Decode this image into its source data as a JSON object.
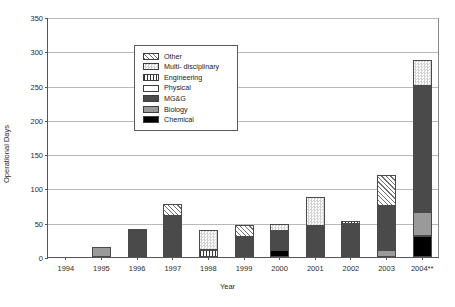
{
  "chart_data": {
    "type": "bar",
    "title": "",
    "xlabel": "Year",
    "ylabel": "Operational Days",
    "ylim": [
      0,
      350
    ],
    "ytick_step": 50,
    "yticks": [
      "350",
      "300",
      "250",
      "200",
      "150",
      "100",
      "50",
      "0"
    ],
    "grid": true,
    "stacked": true,
    "legend_position": "inside-top-left",
    "categories": [
      "1994",
      "1995",
      "1996",
      "1997",
      "1998",
      "1999",
      "2000",
      "2001",
      "2002",
      "2003",
      "2004**"
    ],
    "series": [
      {
        "name": "Chemical",
        "values": [
          0,
          0,
          0,
          0,
          0,
          0,
          10,
          0,
          0,
          0,
          30
        ]
      },
      {
        "name": "Biology",
        "values": [
          0,
          15,
          0,
          0,
          0,
          0,
          0,
          0,
          0,
          10,
          35
        ]
      },
      {
        "name": "MG&G",
        "values": [
          0,
          0,
          41,
          60,
          0,
          29,
          28,
          45,
          48,
          65,
          185
        ]
      },
      {
        "name": "Physical",
        "values": [
          0,
          0,
          0,
          0,
          0,
          0,
          0,
          0,
          0,
          0,
          0
        ]
      },
      {
        "name": "Engineering",
        "values": [
          0,
          0,
          0,
          0,
          10,
          0,
          0,
          0,
          5,
          0,
          0
        ]
      },
      {
        "name": "Multi- disciplinary",
        "values": [
          0,
          0,
          0,
          0,
          30,
          0,
          10,
          43,
          0,
          0,
          38
        ]
      },
      {
        "name": "Other",
        "values": [
          0,
          0,
          0,
          18,
          0,
          18,
          0,
          0,
          0,
          45,
          0
        ]
      }
    ],
    "totals": [
      0,
      15,
      41,
      78,
      40,
      47,
      48,
      88,
      53,
      120,
      288
    ]
  },
  "legend": {
    "items": [
      {
        "label": "Other",
        "pattern": "diagonal-hatch",
        "color": "#6f6f6f"
      },
      {
        "label": "Multi- disciplinary",
        "pattern": "checker-dots",
        "color": "#d2d2d2"
      },
      {
        "label": "Engineering",
        "pattern": "vertical-lines",
        "color": "#333333"
      },
      {
        "label": "Physical",
        "pattern": "solid-white",
        "color": "#ffffff"
      },
      {
        "label": "MG&G",
        "pattern": "solid",
        "color": "#4a4a4a"
      },
      {
        "label": "Biology",
        "pattern": "solid",
        "color": "#9a9a9a"
      },
      {
        "label": "Chemical",
        "pattern": "solid",
        "color": "#000000"
      }
    ]
  }
}
